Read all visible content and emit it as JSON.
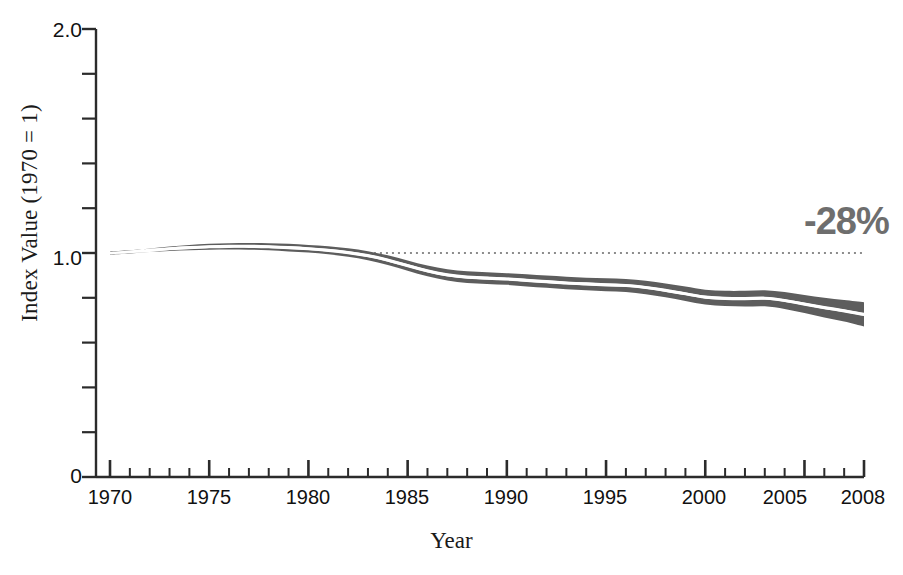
{
  "chart_data": {
    "type": "line",
    "title": "",
    "subtitle": "",
    "xlabel": "Year",
    "ylabel": "Index Value (1970 = 1)",
    "xlim": [
      1970,
      2008
    ],
    "ylim": [
      0,
      2.0
    ],
    "grid": false,
    "legend": "none",
    "y_tick_labels": [
      "2.0",
      "1.0",
      "0"
    ],
    "y_tick_values": [
      2.0,
      1.0,
      0
    ],
    "y_minor_ticks": [
      0.2,
      0.4,
      0.6,
      0.8,
      1.2,
      1.4,
      1.6,
      1.8
    ],
    "x_tick_labels": [
      "1970",
      "1975",
      "1980",
      "1985",
      "1990",
      "1995",
      "2000",
      "2005",
      "2008"
    ],
    "x_tick_values": [
      1970,
      1975,
      1980,
      1985,
      1990,
      1995,
      2000,
      2005,
      2008
    ],
    "x_minor_tick_interval": 1,
    "reference_line": {
      "value": 1.0,
      "style": "dotted",
      "color": "#8c8c8c",
      "x_start": 1983,
      "x_end": 2008
    },
    "annotations": [
      {
        "text": "-28%",
        "x": 2006,
        "y": 1.27,
        "color": "#6e6e6e"
      }
    ],
    "band": {
      "name": "Uncertainty range",
      "fill_color": "#5d5d5d",
      "center_line_color": "#ffffff"
    },
    "x": [
      1970,
      1971,
      1972,
      1973,
      1974,
      1975,
      1976,
      1977,
      1978,
      1979,
      1980,
      1981,
      1982,
      1983,
      1984,
      1985,
      1986,
      1987,
      1988,
      1989,
      1990,
      1991,
      1992,
      1993,
      1994,
      1995,
      1996,
      1997,
      1998,
      1999,
      2000,
      2001,
      2002,
      2003,
      2004,
      2005,
      2006,
      2007,
      2008
    ],
    "series": [
      {
        "name": "Index (central estimate)",
        "values": [
          1.0,
          1.005,
          1.012,
          1.019,
          1.024,
          1.028,
          1.03,
          1.03,
          1.028,
          1.024,
          1.019,
          1.012,
          1.002,
          0.988,
          0.968,
          0.944,
          0.92,
          0.902,
          0.892,
          0.888,
          0.884,
          0.878,
          0.872,
          0.866,
          0.862,
          0.858,
          0.855,
          0.846,
          0.833,
          0.818,
          0.803,
          0.797,
          0.796,
          0.798,
          0.788,
          0.772,
          0.756,
          0.742,
          0.726
        ]
      },
      {
        "name": "Upper bound",
        "values": [
          1.002,
          1.01,
          1.02,
          1.029,
          1.036,
          1.041,
          1.044,
          1.045,
          1.044,
          1.041,
          1.036,
          1.03,
          1.021,
          1.008,
          0.99,
          0.967,
          0.944,
          0.927,
          0.918,
          0.914,
          0.91,
          0.905,
          0.899,
          0.894,
          0.89,
          0.887,
          0.884,
          0.876,
          0.864,
          0.85,
          0.836,
          0.831,
          0.831,
          0.834,
          0.826,
          0.812,
          0.8,
          0.79,
          0.78
        ]
      },
      {
        "name": "Lower bound",
        "values": [
          0.998,
          1.0,
          1.004,
          1.009,
          1.012,
          1.015,
          1.016,
          1.015,
          1.012,
          1.007,
          1.002,
          0.994,
          0.983,
          0.968,
          0.946,
          0.921,
          0.896,
          0.877,
          0.866,
          0.862,
          0.858,
          0.851,
          0.845,
          0.838,
          0.834,
          0.829,
          0.826,
          0.816,
          0.802,
          0.786,
          0.77,
          0.763,
          0.761,
          0.762,
          0.75,
          0.732,
          0.712,
          0.694,
          0.672
        ]
      }
    ],
    "summary_change_percent": -28
  },
  "axes": {
    "y_axis_title": "Index Value (1970 = 1)",
    "x_axis_title": "Year"
  }
}
